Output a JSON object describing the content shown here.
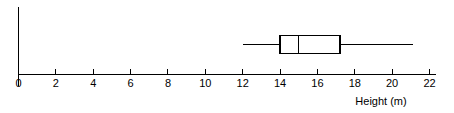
{
  "chart_data": {
    "type": "box",
    "title": "",
    "subtitle": "",
    "xlabel": "Height (m)",
    "ylabel": "",
    "xlim": [
      0,
      22
    ],
    "xtick_step": 2,
    "xticks": [
      0,
      2,
      4,
      6,
      8,
      10,
      12,
      14,
      16,
      18,
      20,
      22
    ],
    "xtick_labels": [
      "0",
      "2",
      "4",
      "6",
      "8",
      "10",
      "12",
      "14",
      "16",
      "18",
      "20",
      "22"
    ],
    "grid": false,
    "legend": null,
    "orientation": "horizontal",
    "series": [
      {
        "name": "Height (m)",
        "min": 12,
        "q1": 14,
        "median": 15,
        "q3": 17.2,
        "max": 21.1,
        "outliers": []
      }
    ],
    "annotations": [],
    "colors": {
      "axis": "#000000",
      "box_stroke": "#000000",
      "box_fill": "#ffffff",
      "whisker": "#000000",
      "median": "#000000",
      "background": "#ffffff",
      "text": "#000000"
    }
  },
  "axis": {
    "x_label": "Height (m)",
    "ticks": [
      {
        "value": 0,
        "label": "0"
      },
      {
        "value": 2,
        "label": "2"
      },
      {
        "value": 4,
        "label": "4"
      },
      {
        "value": 6,
        "label": "6"
      },
      {
        "value": 8,
        "label": "8"
      },
      {
        "value": 10,
        "label": "10"
      },
      {
        "value": 12,
        "label": "12"
      },
      {
        "value": 14,
        "label": "14"
      },
      {
        "value": 16,
        "label": "16"
      },
      {
        "value": 18,
        "label": "18"
      },
      {
        "value": 20,
        "label": "20"
      },
      {
        "value": 22,
        "label": "22"
      }
    ]
  }
}
